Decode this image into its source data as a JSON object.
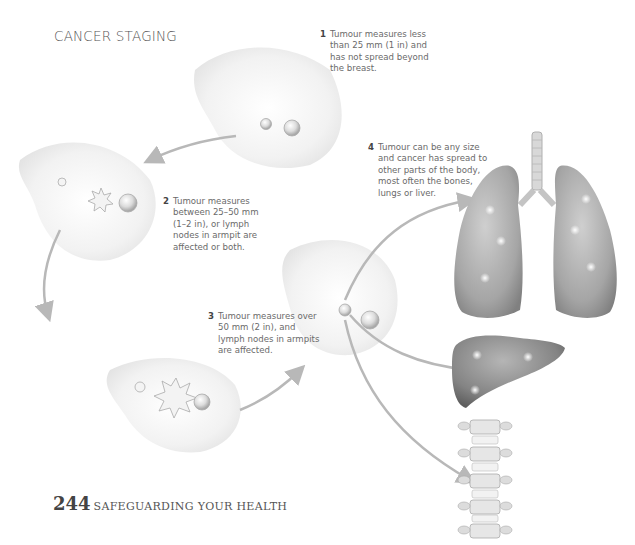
{
  "page": {
    "title": "CANCER STAGING",
    "footer": {
      "page_number": "244",
      "section": "SAFEGUARDING YOUR HEALTH"
    }
  },
  "stages": [
    {
      "number": "1",
      "lines": [
        "Tumour measures less",
        "than 25 mm (1 in) and",
        "has not spread beyond",
        "the breast."
      ]
    },
    {
      "number": "2",
      "lines": [
        "Tumour measures",
        "between 25–50 mm",
        "(1–2 in), or lymph",
        "nodes in armpit are",
        "affected or both."
      ]
    },
    {
      "number": "3",
      "lines": [
        "Tumour measures over",
        "50 mm (2 in), and",
        "lymph nodes in armpits",
        "are affected."
      ]
    },
    {
      "number": "4",
      "lines": [
        "Tumour can be any size",
        "and cancer has spread to",
        "other parts of the body,",
        "most often the bones,",
        "lungs or liver."
      ]
    }
  ],
  "illustrations": {
    "breast_stage_1": "breast-illustration",
    "breast_stage_2": "breast-illustration",
    "breast_stage_3": "breast-illustration",
    "breast_stage_4": "breast-illustration",
    "organs": [
      "lungs",
      "liver",
      "spine"
    ]
  },
  "colors": {
    "text": "#6a6a6a",
    "arrow": "#b8b8b8",
    "organ": "#9a9a9a",
    "organ_dark": "#6e6e6e"
  }
}
